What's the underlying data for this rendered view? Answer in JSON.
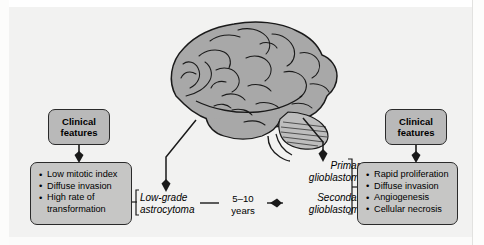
{
  "diagram": {
    "background_color": "#f2f2f1",
    "box_fill_header": "#b9b9b9",
    "box_fill_list": "#c6c6c5",
    "stroke_color": "#2a2a2a"
  },
  "left_panel": {
    "header": {
      "line1": "Clinical",
      "line2": "features"
    },
    "features": [
      "Low mitotic index",
      "Diffuse invasion",
      "High rate of",
      "transformation"
    ]
  },
  "right_panel": {
    "header": {
      "line1": "Clinical",
      "line2": "features"
    },
    "features": [
      "Rapid proliferation",
      "Diffuse invasion",
      "Angiogenesis",
      "Cellular necrosis"
    ]
  },
  "center": {
    "low_grade": {
      "line1": "Low-grade",
      "line2": "astrocytoma"
    },
    "primary": {
      "line1": "Primary",
      "line2": "glioblastoma"
    },
    "secondary": {
      "line1": "Secondary",
      "line2": "glioblastoma"
    },
    "interval": {
      "line1": "5–10",
      "line2": "years"
    }
  },
  "illustration": {
    "name": "brain-lateral-view",
    "fill": "#a8a8a8",
    "stroke": "#1a1a1a"
  }
}
